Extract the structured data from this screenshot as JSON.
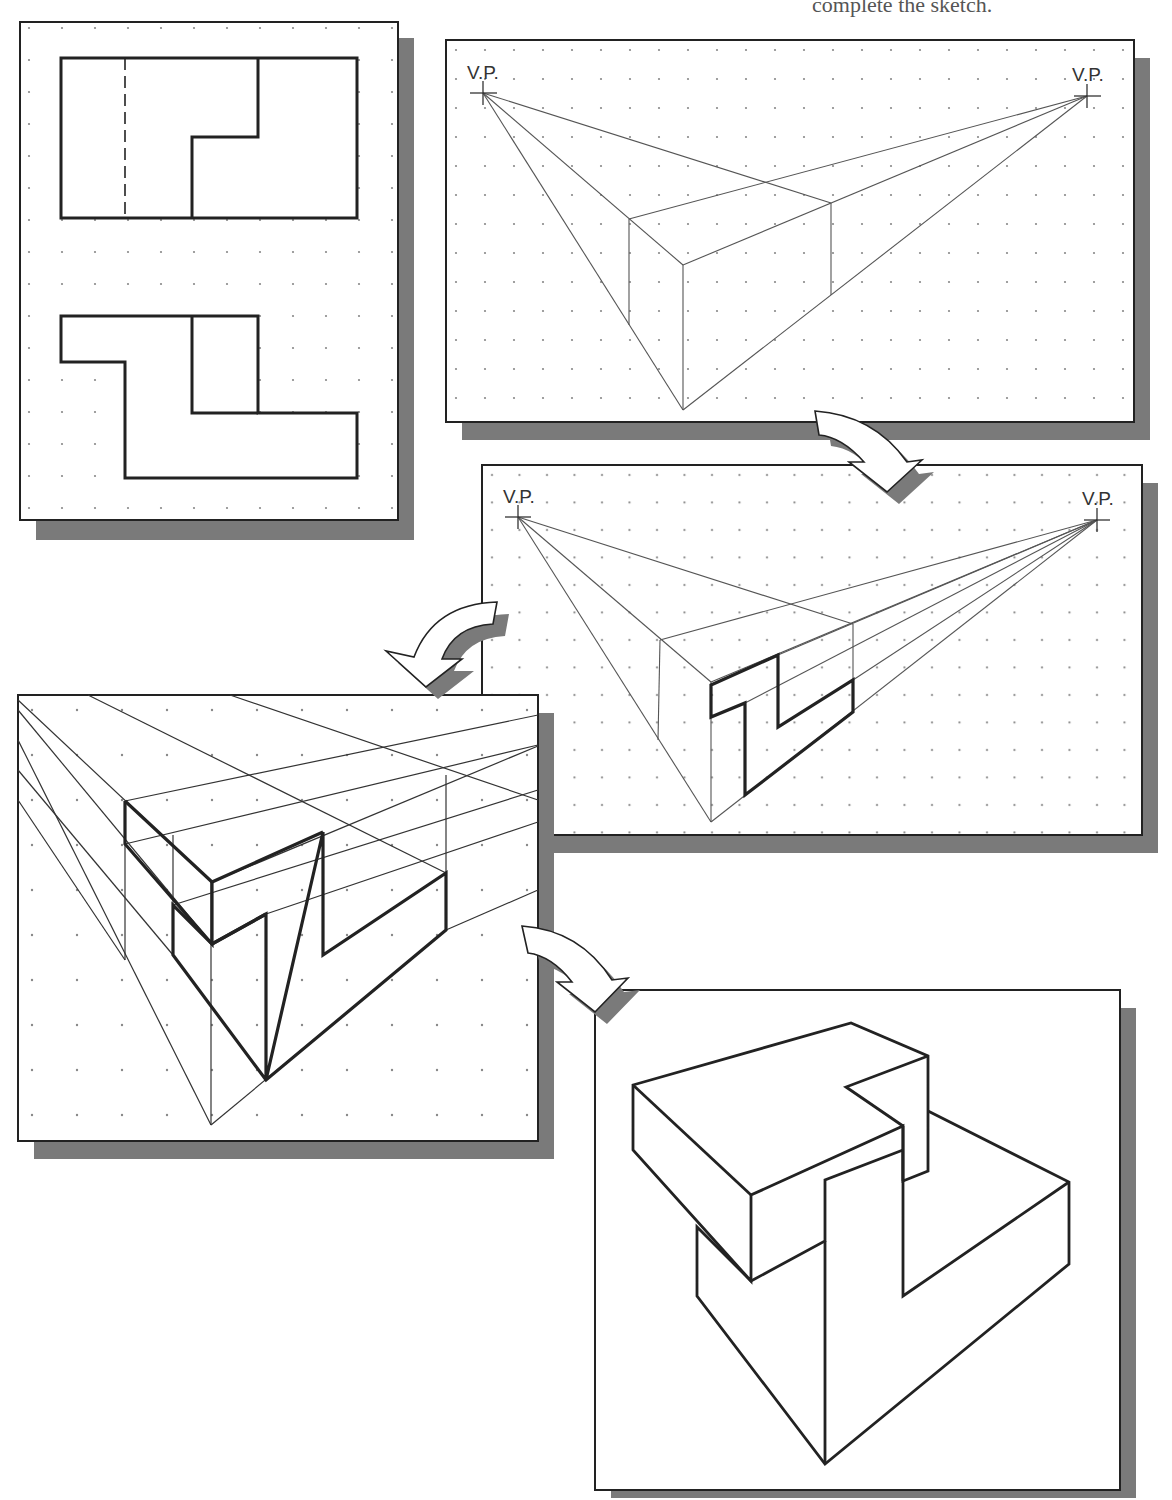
{
  "header": {
    "partial_text": "complete the sketch."
  },
  "panels": [
    {
      "id": "orthographic-views",
      "description": "Top view and front view of Z-shaped block on dot grid"
    },
    {
      "id": "step-1-box",
      "description": "Two-point perspective bounding box",
      "vp_left_label": "V.P.",
      "vp_right_label": "V.P."
    },
    {
      "id": "step-2-front-face",
      "description": "Z-shaped front face outlined on box",
      "vp_left_label": "V.P.",
      "vp_right_label": "V.P."
    },
    {
      "id": "step-3-enlarged",
      "description": "Enlarged view with projection lines and top face"
    },
    {
      "id": "step-4-final",
      "description": "Completed perspective sketch of Z-shaped block"
    }
  ],
  "arrows": [
    {
      "id": "arrow-1",
      "direction": "panel 2 to panel 3"
    },
    {
      "id": "arrow-2",
      "direction": "panel 3 to panel 4"
    },
    {
      "id": "arrow-3",
      "direction": "panel 4 to panel 5"
    }
  ],
  "colors": {
    "line": "#222222",
    "thin_line": "#444444",
    "shadow": "#7a7a7a",
    "dot": "#888888",
    "paper": "#ffffff"
  }
}
